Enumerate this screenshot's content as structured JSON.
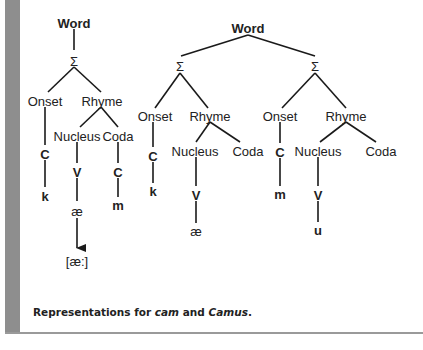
{
  "figure": {
    "caption": {
      "prefix": "Representations for ",
      "word1": "cam",
      "middle": " and ",
      "word2": "Camus",
      "suffix": "."
    },
    "trees": [
      {
        "id": "cam",
        "root": "Word",
        "syllables": [
          {
            "node": "Σ",
            "onset": {
              "label": "Onset",
              "slot": "C",
              "segment": "k"
            },
            "rhyme": {
              "label": "Rhyme",
              "nucleus": {
                "label": "Nucleus",
                "slot": "V",
                "segment": "æ",
                "surface": "[æ:]"
              },
              "coda": {
                "label": "Coda",
                "slot": "C",
                "segment": "m"
              }
            }
          }
        ]
      },
      {
        "id": "Camus",
        "root": "Word",
        "syllables": [
          {
            "node": "Σ",
            "onset": {
              "label": "Onset",
              "slot": "C",
              "segment": "k"
            },
            "rhyme": {
              "label": "Rhyme",
              "nucleus": {
                "label": "Nucleus",
                "slot": "V",
                "segment": "æ"
              },
              "coda": {
                "label": "Coda"
              }
            }
          },
          {
            "node": "Σ",
            "onset": {
              "label": "Onset",
              "slot": "C",
              "segment": "m"
            },
            "rhyme": {
              "label": "Rhyme",
              "nucleus": {
                "label": "Nucleus",
                "slot": "V",
                "segment": "u"
              },
              "coda": {
                "label": "Coda"
              }
            }
          }
        ]
      }
    ]
  },
  "colors": {
    "sidebar": "#8e8e8e",
    "line": "#1a1a1a",
    "text": "#222222"
  }
}
